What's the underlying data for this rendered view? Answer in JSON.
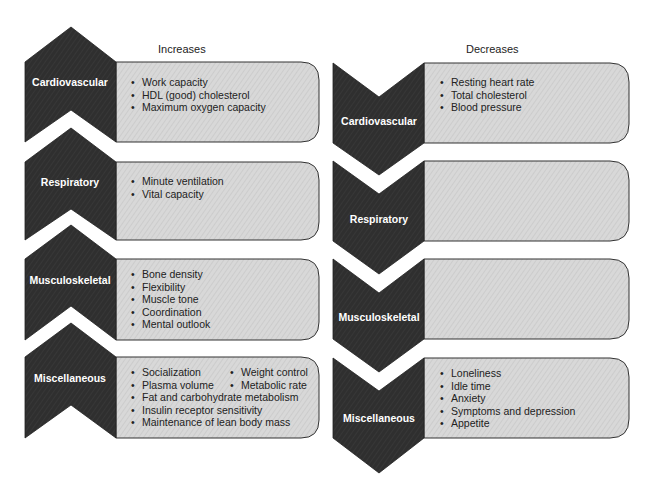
{
  "colors": {
    "chevron_fill": "#2e2e2e",
    "box_fill": "#d6d6d6",
    "box_stroke": "#333333",
    "label_text": "#ffffff",
    "body_text": "#222222"
  },
  "increases": {
    "heading": "Increases",
    "rows": [
      {
        "category": "Cardiovascular",
        "items": [
          "Work capacity",
          "HDL (good) cholesterol",
          "Maximum oxygen capacity"
        ]
      },
      {
        "category": "Respiratory",
        "items": [
          "Minute ventilation",
          "Vital capacity"
        ]
      },
      {
        "category": "Musculoskeletal",
        "items": [
          "Bone density",
          "Flexibility",
          "Muscle tone",
          "Coordination",
          "Mental outlook"
        ]
      },
      {
        "category": "Miscellaneous",
        "paired_items": [
          [
            "Socialization",
            "Weight control"
          ],
          [
            "Plasma volume",
            "Metabolic rate"
          ]
        ],
        "items": [
          "Fat and carbohydrate metabolism",
          "Insulin receptor sensitivity",
          "Maintenance of lean body mass"
        ]
      }
    ]
  },
  "decreases": {
    "heading": "Decreases",
    "rows": [
      {
        "category": "Cardiovascular",
        "items": [
          "Resting heart rate",
          "Total cholesterol",
          "Blood pressure"
        ]
      },
      {
        "category": "Respiratory",
        "items": []
      },
      {
        "category": "Musculoskeletal",
        "items": []
      },
      {
        "category": "Miscellaneous",
        "items": [
          "Loneliness",
          "Idle time",
          "Anxiety",
          "Symptoms and depression",
          "Appetite"
        ]
      }
    ]
  }
}
